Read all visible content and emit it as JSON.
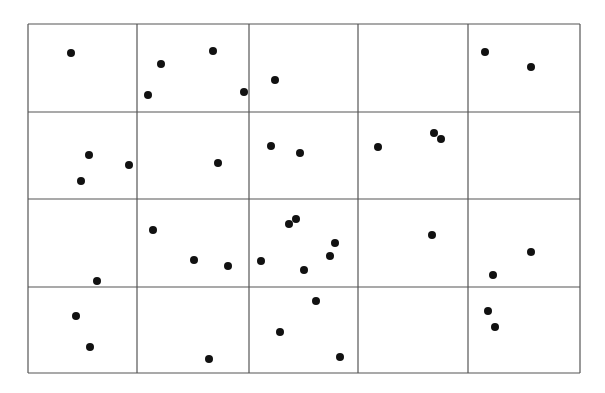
{
  "figure": {
    "grid": {
      "columns": 5,
      "rows": 4,
      "x_lines": [
        28,
        137,
        249,
        358,
        468,
        580
      ],
      "y_lines": [
        24,
        112,
        199,
        287,
        373
      ],
      "line_color": "#555555"
    },
    "dot_color": "#111111",
    "dot_radius": 4,
    "points": [
      {
        "x": 71,
        "y": 53
      },
      {
        "x": 161,
        "y": 64
      },
      {
        "x": 213,
        "y": 51
      },
      {
        "x": 148,
        "y": 95
      },
      {
        "x": 244,
        "y": 92
      },
      {
        "x": 275,
        "y": 80
      },
      {
        "x": 485,
        "y": 52
      },
      {
        "x": 531,
        "y": 67
      },
      {
        "x": 89,
        "y": 155
      },
      {
        "x": 81,
        "y": 181
      },
      {
        "x": 129,
        "y": 165
      },
      {
        "x": 218,
        "y": 163
      },
      {
        "x": 271,
        "y": 146
      },
      {
        "x": 300,
        "y": 153
      },
      {
        "x": 378,
        "y": 147
      },
      {
        "x": 434,
        "y": 133
      },
      {
        "x": 441,
        "y": 139
      },
      {
        "x": 153,
        "y": 230
      },
      {
        "x": 97,
        "y": 281
      },
      {
        "x": 194,
        "y": 260
      },
      {
        "x": 228,
        "y": 266
      },
      {
        "x": 261,
        "y": 261
      },
      {
        "x": 289,
        "y": 224
      },
      {
        "x": 296,
        "y": 219
      },
      {
        "x": 335,
        "y": 243
      },
      {
        "x": 330,
        "y": 256
      },
      {
        "x": 304,
        "y": 270
      },
      {
        "x": 432,
        "y": 235
      },
      {
        "x": 531,
        "y": 252
      },
      {
        "x": 493,
        "y": 275
      },
      {
        "x": 76,
        "y": 316
      },
      {
        "x": 90,
        "y": 347
      },
      {
        "x": 209,
        "y": 359
      },
      {
        "x": 316,
        "y": 301
      },
      {
        "x": 280,
        "y": 332
      },
      {
        "x": 340,
        "y": 357
      },
      {
        "x": 488,
        "y": 311
      },
      {
        "x": 495,
        "y": 327
      }
    ]
  }
}
